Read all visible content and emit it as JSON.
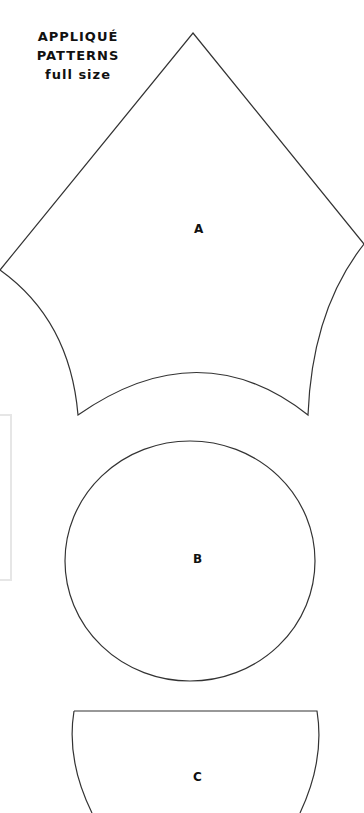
{
  "page": {
    "title_lines": [
      "APPLIQUÉ",
      "PATTERNS",
      "full size"
    ]
  },
  "patterns": [
    {
      "id": "A",
      "label": "A",
      "shape": "diamond-with-concave-bottom"
    },
    {
      "id": "B",
      "label": "B",
      "shape": "circle"
    },
    {
      "id": "C",
      "label": "C",
      "shape": "half-circle"
    }
  ],
  "colors": {
    "outline": "#333333",
    "background": "#ffffff",
    "faint_box": "#e6e6e6"
  }
}
